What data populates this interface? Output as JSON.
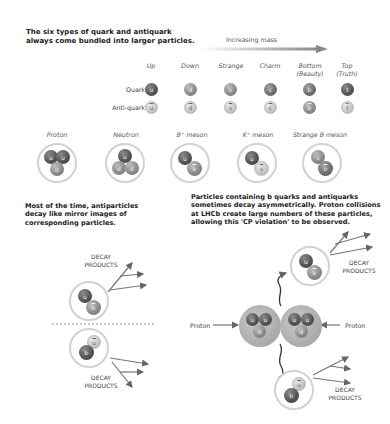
{
  "intro": {
    "line1": "The six types of quark and antiquark",
    "line2": "always come bundled into larger particles."
  },
  "mass_axis": {
    "label": "Increasing mass"
  },
  "flavours": [
    {
      "name": "Up",
      "sub": "",
      "quark": "u",
      "anti": "u"
    },
    {
      "name": "Down",
      "sub": "",
      "quark": "d",
      "anti": "d"
    },
    {
      "name": "Strange",
      "sub": "",
      "quark": "s",
      "anti": "s"
    },
    {
      "name": "Charm",
      "sub": "",
      "quark": "c",
      "anti": "c"
    },
    {
      "name": "Bottom",
      "sub": "(Beauty)",
      "quark": "b",
      "anti": "b"
    },
    {
      "name": "Top",
      "sub": "(Truth)",
      "quark": "t",
      "anti": "t"
    }
  ],
  "row_labels": {
    "quark": "Quark",
    "anti": "Anti-quark"
  },
  "particles": [
    {
      "name": "Proton",
      "quarks": [
        "u",
        "u",
        "d"
      ]
    },
    {
      "name": "Neutron",
      "quarks": [
        "u",
        "d",
        "d"
      ]
    },
    {
      "name": "B⁺ meson",
      "quarks": [
        "u",
        "b"
      ]
    },
    {
      "name": "K⁺ meson",
      "quarks": [
        "u",
        "s"
      ]
    },
    {
      "name": "Strange B meson",
      "quarks": [
        "s",
        "b"
      ]
    }
  ],
  "left_text": {
    "line1": "Most of the time, antiparticles",
    "line2": "decay like mirror images of",
    "line3": "corresponding particles."
  },
  "right_text": {
    "line1": "Particles containing b quarks and antiquarks",
    "line2": "sometimes decay asymmetrically. Proton collisions",
    "line3": "at LHCb create large numbers of these particles,",
    "line4": "allowing this 'CP violation' to be observed."
  },
  "decay": {
    "line1": "DECAY",
    "line2": "PRODUCTS"
  },
  "collision": {
    "left_label": "Proton",
    "right_label": "Proton",
    "left_quarks": [
      "u",
      "u",
      "d"
    ],
    "right_quarks": [
      "u",
      "u",
      "d"
    ],
    "top_product": [
      "u",
      "b"
    ],
    "bottom_product": [
      "u",
      "b"
    ]
  },
  "mirror": {
    "top_product": [
      "u",
      "b"
    ],
    "bottom_product": [
      "u",
      "b"
    ]
  }
}
